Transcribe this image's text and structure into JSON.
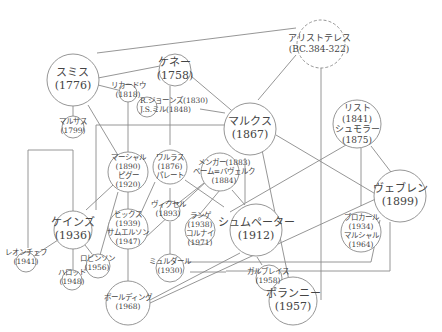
{
  "diagram": {
    "nodes": [
      {
        "id": "aristotle",
        "name": "アリストテレス",
        "year": "(BC.384-322)",
        "dashed": true
      },
      {
        "id": "smith",
        "name": "スミス",
        "year": "(1776)"
      },
      {
        "id": "quesnay",
        "name": "ケネー",
        "year": "(1758)"
      },
      {
        "id": "ricardo",
        "name": "リカードウ",
        "year": "(1818)"
      },
      {
        "id": "jones_mill",
        "name": "R.ジョーンズ(1830)",
        "year": "J.S.ミル(1848)"
      },
      {
        "id": "malthus",
        "name": "マルサス",
        "year": "(1799)"
      },
      {
        "id": "marx",
        "name": "マルクス",
        "year": "(1867)"
      },
      {
        "id": "list_schmoller",
        "name": "リスト",
        "year": "(1841)",
        "name2": "シュモラー",
        "year2": "(1875)"
      },
      {
        "id": "walras_pareto",
        "name": "ワルラス",
        "year": "(1876)",
        "name2": "パレート"
      },
      {
        "id": "menger_bawerk",
        "name": "メンガー(1883)",
        "year": "ベーム=バヴェルク",
        "year2": "(1884)"
      },
      {
        "id": "marshall_pigou",
        "name": "マーシャル",
        "year": "(1890)",
        "name2": "ピグー",
        "year2": "(1920)"
      },
      {
        "id": "wicksell",
        "name": "ヴィクセル",
        "year": "(1893)"
      },
      {
        "id": "veblen",
        "name": "ヴェブレン",
        "year": "(1899)"
      },
      {
        "id": "keynes",
        "name": "ケインズ",
        "year": "(1936)"
      },
      {
        "id": "hicks_samuelson",
        "name": "ヒックス",
        "year": "(1939)",
        "name2": "サムエルソン",
        "year2": "(1947)"
      },
      {
        "id": "lange_kornai",
        "name": "ランゲ",
        "year": "(1938)",
        "name2": "コルナイ",
        "year2": "(1971)"
      },
      {
        "id": "schumpeter",
        "name": "シュムペーター",
        "year": "(1912)"
      },
      {
        "id": "polanyi_marshall",
        "name": "ブロカール",
        "year": "(1934)",
        "name2": "マルシャル",
        "year2": "(1964)"
      },
      {
        "id": "leontief",
        "name": "レオンチェフ",
        "year": "(1941)"
      },
      {
        "id": "robinson",
        "name": "ロビンソン",
        "year": "(1956)"
      },
      {
        "id": "harrod",
        "name": "ハロッド",
        "year": "(1948)"
      },
      {
        "id": "myrdal",
        "name": "ミュルダール",
        "year": "(1930)"
      },
      {
        "id": "galbraith",
        "name": "ガルブレイス",
        "year": "(1958)"
      },
      {
        "id": "boulding",
        "name": "ボールディング",
        "year": "(1968)"
      },
      {
        "id": "polanyi",
        "name": "ポランニー",
        "year": "(1957)"
      }
    ]
  }
}
